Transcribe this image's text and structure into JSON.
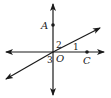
{
  "diagram": {
    "points": {
      "A": {
        "label": "A",
        "x": 53,
        "y": 25
      },
      "C": {
        "label": "C",
        "x": 87,
        "y": 52
      },
      "O": {
        "label": "O",
        "x": 53,
        "y": 52
      }
    },
    "angles": {
      "angle1": {
        "label": "1"
      },
      "angle2": {
        "label": "2"
      },
      "angle3": {
        "label": "3"
      }
    },
    "lines": [
      {
        "name": "vertical-line",
        "through": [
          "A",
          "O"
        ]
      },
      {
        "name": "horizontal-line",
        "through": [
          "O",
          "C"
        ]
      },
      {
        "name": "diagonal-line",
        "through": [
          "O"
        ]
      }
    ],
    "colors": {
      "stroke": "#1a1a1a",
      "background": "#ffffff"
    }
  }
}
